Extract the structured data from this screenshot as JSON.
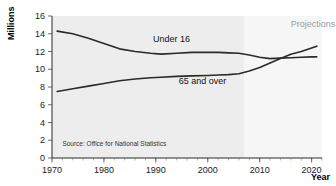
{
  "chart_data": {
    "type": "line",
    "title": "",
    "xlabel": "Year",
    "ylabel": "Millions",
    "xlim": [
      1970,
      2022
    ],
    "ylim": [
      0,
      16
    ],
    "yticks": [
      0,
      2,
      4,
      6,
      8,
      10,
      12,
      14,
      16
    ],
    "xticks": [
      1970,
      1980,
      1990,
      2000,
      2010,
      2020
    ],
    "grid": false,
    "legend_position": "inline-labels",
    "annotations": [
      {
        "name": "projections",
        "text": "Projections",
        "x": 2016,
        "y": 14.8
      },
      {
        "name": "source",
        "text": "Source: Office for National Statistics",
        "x": 1972,
        "y": 1.4
      }
    ],
    "shaded_regions": [
      {
        "name": "historic",
        "from": 1970,
        "to": 2007,
        "color": "#eceaea"
      },
      {
        "name": "projected",
        "from": 2007,
        "to": 2022,
        "color": "#f7f6f6"
      }
    ],
    "series": [
      {
        "name": "Under 16",
        "label_x": 1993,
        "label_y": 13.1,
        "color": "#2a2a2a",
        "x": [
          1971,
          1974,
          1977,
          1980,
          1983,
          1986,
          1989,
          1991,
          1994,
          1997,
          2000,
          2002,
          2004,
          2006,
          2008,
          2010,
          2012,
          2014,
          2016,
          2018,
          2020,
          2021
        ],
        "values": [
          14.3,
          14.0,
          13.5,
          12.9,
          12.3,
          12.0,
          11.8,
          11.7,
          11.8,
          11.9,
          11.9,
          11.9,
          11.85,
          11.8,
          11.6,
          11.35,
          11.2,
          11.25,
          11.3,
          11.35,
          11.4,
          11.4
        ]
      },
      {
        "name": "65 and over",
        "label_x": 1999,
        "label_y": 8.3,
        "color": "#2a2a2a",
        "x": [
          1971,
          1974,
          1977,
          1980,
          1983,
          1986,
          1989,
          1991,
          1994,
          1997,
          2000,
          2002,
          2004,
          2006,
          2008,
          2010,
          2012,
          2014,
          2016,
          2018,
          2020,
          2021
        ],
        "values": [
          7.5,
          7.8,
          8.1,
          8.4,
          8.7,
          8.9,
          9.05,
          9.1,
          9.2,
          9.25,
          9.3,
          9.35,
          9.4,
          9.5,
          9.8,
          10.2,
          10.7,
          11.2,
          11.7,
          12.0,
          12.4,
          12.6
        ]
      }
    ]
  },
  "axis": {
    "y_title": "Millions",
    "x_title": "Year"
  }
}
